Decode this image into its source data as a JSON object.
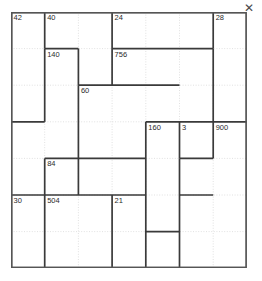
{
  "window": {
    "close_label": "✕",
    "close_icon": "close-icon"
  },
  "grid": {
    "columns": 7,
    "rows": 7,
    "cell_width": 33.7,
    "cell_height": 36.6,
    "outer_border_color": "#555555",
    "cage_border_color": "#3a3a3a",
    "inner_grid_color": "#d9d9d9",
    "background": "#ffffff",
    "clue_text_color": "#2b2b2b"
  },
  "chart_data": {
    "type": "table",
    "title": "",
    "xlabel": "",
    "ylabel": "",
    "puzzle_kind": "kenken-multiplication-grid",
    "columns": 7,
    "rows": 7,
    "clues": [
      {
        "text": "42",
        "col": 0,
        "row": 0
      },
      {
        "text": "40",
        "col": 1,
        "row": 0
      },
      {
        "text": "24",
        "col": 3,
        "row": 0
      },
      {
        "text": "28",
        "col": 6,
        "row": 0
      },
      {
        "text": "140",
        "col": 1,
        "row": 1
      },
      {
        "text": "756",
        "col": 3,
        "row": 1
      },
      {
        "text": "60",
        "col": 2,
        "row": 2
      },
      {
        "text": "160",
        "col": 4,
        "row": 3
      },
      {
        "text": "3",
        "col": 5,
        "row": 3
      },
      {
        "text": "900",
        "col": 6,
        "row": 3
      },
      {
        "text": "84",
        "col": 1,
        "row": 4
      },
      {
        "text": "30",
        "col": 0,
        "row": 5
      },
      {
        "text": "504",
        "col": 1,
        "row": 5
      },
      {
        "text": "21",
        "col": 3,
        "row": 5
      }
    ],
    "cage_segments_horizontal": [
      {
        "col": 1,
        "row": 1,
        "span": 1
      },
      {
        "col": 3,
        "row": 1,
        "span": 3
      },
      {
        "col": 2,
        "row": 2,
        "span": 3
      },
      {
        "col": 0,
        "row": 3,
        "span": 1
      },
      {
        "col": 4,
        "row": 3,
        "span": 3
      },
      {
        "col": 5,
        "row": 4,
        "span": 1
      },
      {
        "col": 1,
        "row": 4,
        "span": 3
      },
      {
        "col": 0,
        "row": 5,
        "span": 4
      },
      {
        "col": 5,
        "row": 5,
        "span": 1
      },
      {
        "col": 4,
        "row": 6,
        "span": 1
      }
    ],
    "cage_segments_vertical": [
      {
        "col": 1,
        "row": 0,
        "span": 1
      },
      {
        "col": 6,
        "row": 0,
        "span": 1
      },
      {
        "col": 2,
        "row": 1,
        "span": 1
      },
      {
        "col": 3,
        "row": 0,
        "span": 2
      },
      {
        "col": 1,
        "row": 1,
        "span": 2
      },
      {
        "col": 2,
        "row": 2,
        "span": 3
      },
      {
        "col": 6,
        "row": 1,
        "span": 2
      },
      {
        "col": 4,
        "row": 3,
        "span": 4
      },
      {
        "col": 5,
        "row": 3,
        "span": 1
      },
      {
        "col": 6,
        "row": 3,
        "span": 1
      },
      {
        "col": 1,
        "row": 4,
        "span": 3
      },
      {
        "col": 5,
        "row": 4,
        "span": 3
      },
      {
        "col": 3,
        "row": 5,
        "span": 2
      }
    ]
  }
}
